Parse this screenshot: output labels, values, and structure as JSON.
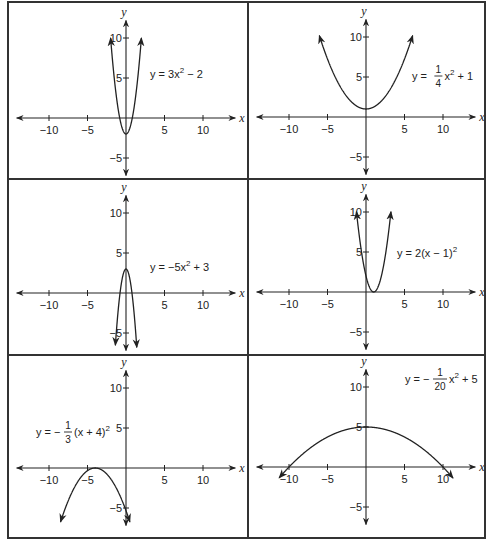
{
  "figure": {
    "layout": "3 rows x 2 columns of parabola graphs",
    "axis_labels": {
      "x": "x",
      "y": "y"
    },
    "x_tick_labels": [
      "−10",
      "−5",
      "5",
      "10"
    ],
    "y_tick_labels": [
      "10",
      "5",
      "−5"
    ]
  },
  "panels": [
    {
      "equation": "y = 3x² − 2",
      "eq_parts": {
        "pre": "y = 3x",
        "sup": "2",
        "post": " − 2"
      }
    },
    {
      "equation": "y = (1/4)x² + 1",
      "eq_parts": {
        "pre": "y = ",
        "num": "1",
        "den": "4",
        "mid": "x",
        "sup": "2",
        "post": " + 1"
      }
    },
    {
      "equation": "y = −5x² + 3",
      "eq_parts": {
        "pre": "y = −5x",
        "sup": "2",
        "post": " + 3"
      }
    },
    {
      "equation": "y = 2(x − 1)²",
      "eq_parts": {
        "pre": "y = 2(x − 1)",
        "sup": "2",
        "post": ""
      }
    },
    {
      "equation": "y = −(1/3)(x + 4)²",
      "eq_parts": {
        "pre": "y = −",
        "num": "1",
        "den": "3",
        "mid": "(x + 4)",
        "sup": "2",
        "post": ""
      }
    },
    {
      "equation": "y = −(1/20)x² + 5",
      "eq_parts": {
        "pre": "y = −",
        "num": "1",
        "den": "20",
        "mid": "x",
        "sup": "2",
        "post": " + 5"
      }
    }
  ],
  "chart_data": [
    {
      "type": "line",
      "title": "y = 3x^2 - 2",
      "a": 3,
      "h": 0,
      "k": -2,
      "vertex": [
        0,
        -2
      ],
      "opens": "up",
      "xlim": [
        -13,
        13
      ],
      "ylim": [
        -7,
        12
      ],
      "x_ticks": [
        -10,
        -5,
        5,
        10
      ],
      "y_ticks": [
        -5,
        5,
        10
      ],
      "grid": false
    },
    {
      "type": "line",
      "title": "y = 1/4 x^2 + 1",
      "a": 0.25,
      "h": 0,
      "k": 1,
      "vertex": [
        0,
        1
      ],
      "opens": "up",
      "xlim": [
        -13,
        13
      ],
      "ylim": [
        -7,
        12
      ],
      "x_ticks": [
        -10,
        -5,
        5,
        10
      ],
      "y_ticks": [
        -5,
        5,
        10
      ],
      "grid": false
    },
    {
      "type": "line",
      "title": "y = -5x^2 + 3",
      "a": -5,
      "h": 0,
      "k": 3,
      "vertex": [
        0,
        3
      ],
      "opens": "down",
      "xlim": [
        -13,
        13
      ],
      "ylim": [
        -7,
        12
      ],
      "x_ticks": [
        -10,
        -5,
        5,
        10
      ],
      "y_ticks": [
        -5,
        5,
        10
      ],
      "grid": false
    },
    {
      "type": "line",
      "title": "y = 2(x - 1)^2",
      "a": 2,
      "h": 1,
      "k": 0,
      "vertex": [
        1,
        0
      ],
      "opens": "up",
      "xlim": [
        -13,
        13
      ],
      "ylim": [
        -7,
        12
      ],
      "x_ticks": [
        -10,
        -5,
        5,
        10
      ],
      "y_ticks": [
        -5,
        5,
        10
      ],
      "grid": false
    },
    {
      "type": "line",
      "title": "y = -1/3 (x + 4)^2",
      "a": -0.3333,
      "h": -4,
      "k": 0,
      "vertex": [
        -4,
        0
      ],
      "opens": "down",
      "xlim": [
        -13,
        13
      ],
      "ylim": [
        -7,
        12
      ],
      "x_ticks": [
        -10,
        -5,
        5,
        10
      ],
      "y_ticks": [
        -5,
        5,
        10
      ],
      "grid": false
    },
    {
      "type": "line",
      "title": "y = -1/20 x^2 + 5",
      "a": -0.05,
      "h": 0,
      "k": 5,
      "vertex": [
        0,
        5
      ],
      "opens": "down",
      "xlim": [
        -13,
        13
      ],
      "ylim": [
        -7,
        12
      ],
      "x_ticks": [
        -10,
        -5,
        5,
        10
      ],
      "y_ticks": [
        -5,
        5,
        10
      ],
      "grid": false
    }
  ]
}
